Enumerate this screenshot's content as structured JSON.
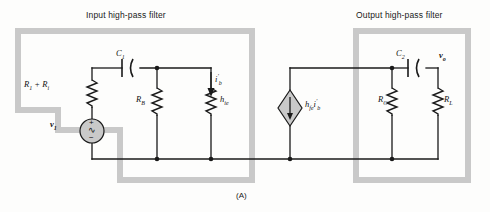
{
  "figure": {
    "caption": "(A)",
    "input_filter_title": "Input high-pass filter",
    "output_filter_title": "Output high-pass filter",
    "highlight_color": "#c8c8c8",
    "wire_color": "#1a1a1a",
    "background": "#fdfdfc"
  },
  "labels": {
    "c1": "C",
    "c1_sub": "1",
    "c2": "C",
    "c2_sub": "2",
    "vo": "v",
    "vo_sub": "o",
    "v1": "v",
    "v1_sub": "1",
    "r1_ri": "R",
    "r1_sub": "1",
    "r1_plus": " + R",
    "ri_sub": "i",
    "rb": "R",
    "rb_sub": "B",
    "hie": "h",
    "hie_sub": "ie",
    "ib": "i",
    "ib_sup": "'",
    "ib_sub": "b",
    "hfe": "h",
    "hfe_sub": "fe",
    "hfe_i": "i",
    "hfe_i_sup": "'",
    "hfe_i_sub": "b",
    "rc": "R",
    "rc_sub": "C",
    "rl": "R",
    "rl_sub": "L"
  },
  "source": {
    "plus_sign": "+",
    "minus_sign": "−",
    "ac_symbol": "∿"
  },
  "components": [
    {
      "name": "capacitor-c1",
      "label": "C1",
      "type": "capacitor"
    },
    {
      "name": "capacitor-c2",
      "label": "C2",
      "type": "capacitor"
    },
    {
      "name": "resistor-r1-ri",
      "label": "R1 + Ri",
      "type": "resistor"
    },
    {
      "name": "resistor-rb",
      "label": "RB",
      "type": "resistor"
    },
    {
      "name": "resistor-hie",
      "label": "hie",
      "type": "resistor"
    },
    {
      "name": "resistor-rc",
      "label": "RC",
      "type": "resistor"
    },
    {
      "name": "resistor-rl",
      "label": "RL",
      "type": "resistor"
    },
    {
      "name": "voltage-source-v1",
      "label": "v1",
      "type": "ac-source"
    },
    {
      "name": "dependent-current-source",
      "label": "hfe i'b",
      "type": "diamond-source"
    },
    {
      "name": "current-arrow-ib",
      "label": "i'b",
      "type": "current-arrow"
    }
  ]
}
